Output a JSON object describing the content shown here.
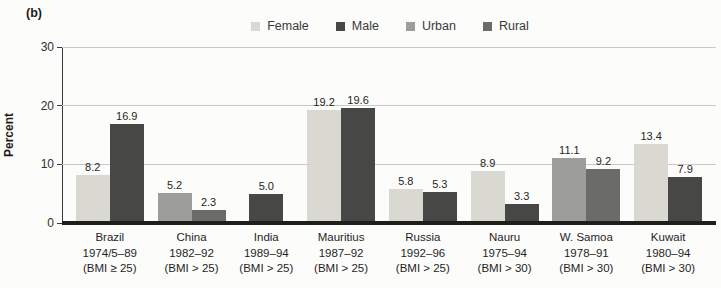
{
  "figure": {
    "panel_label": "(b)"
  },
  "chart_data": {
    "type": "bar",
    "title": "",
    "ylabel": "Percent",
    "xlabel": "",
    "ylim": [
      0,
      30
    ],
    "yticks": [
      0,
      10,
      20,
      30
    ],
    "grid": "horizontal",
    "legend_position": "top-center",
    "legend": [
      {
        "name": "Female",
        "color": "#d9d9d1"
      },
      {
        "name": "Male",
        "color": "#474745"
      },
      {
        "name": "Urban",
        "color": "#9d9d99"
      },
      {
        "name": "Rural",
        "color": "#6b6b67"
      }
    ],
    "groups": [
      {
        "label_lines": [
          "Brazil",
          "1974/5–89",
          "(BMI ≥ 25)"
        ],
        "bars": [
          {
            "series": "Female",
            "value": 8.2,
            "label": "8.2"
          },
          {
            "series": "Male",
            "value": 16.9,
            "label": "16.9"
          }
        ]
      },
      {
        "label_lines": [
          "China",
          "1982–92",
          "(BMI > 25)"
        ],
        "bars": [
          {
            "series": "Urban",
            "value": 5.2,
            "label": "5.2"
          },
          {
            "series": "Rural",
            "value": 2.3,
            "label": "2.3"
          }
        ]
      },
      {
        "label_lines": [
          "India",
          "1989–94",
          "(BMI > 25)"
        ],
        "bars": [
          {
            "series": "Male",
            "value": 5.0,
            "label": "5.0"
          }
        ]
      },
      {
        "label_lines": [
          "Mauritius",
          "1987–92",
          "(BMI > 25)"
        ],
        "bars": [
          {
            "series": "Female",
            "value": 19.2,
            "label": "19.2"
          },
          {
            "series": "Male",
            "value": 19.6,
            "label": "19.6"
          }
        ]
      },
      {
        "label_lines": [
          "Russia",
          "1992–96",
          "(BMI > 25)"
        ],
        "bars": [
          {
            "series": "Female",
            "value": 5.8,
            "label": "5.8"
          },
          {
            "series": "Male",
            "value": 5.3,
            "label": "5.3"
          }
        ]
      },
      {
        "label_lines": [
          "Nauru",
          "1975–94",
          "(BMI > 30)"
        ],
        "bars": [
          {
            "series": "Female",
            "value": 8.9,
            "label": "8.9"
          },
          {
            "series": "Male",
            "value": 3.3,
            "label": "3.3"
          }
        ]
      },
      {
        "label_lines": [
          "W. Samoa",
          "1978–91",
          "(BMI > 30)"
        ],
        "bars": [
          {
            "series": "Urban",
            "value": 11.1,
            "label": "11.1"
          },
          {
            "series": "Rural",
            "value": 9.2,
            "label": "9.2"
          }
        ]
      },
      {
        "label_lines": [
          "Kuwait",
          "1980–94",
          "(BMI > 30)"
        ],
        "bars": [
          {
            "series": "Female",
            "value": 13.4,
            "label": "13.4"
          },
          {
            "series": "Male",
            "value": 7.9,
            "label": "7.9"
          }
        ]
      }
    ]
  }
}
